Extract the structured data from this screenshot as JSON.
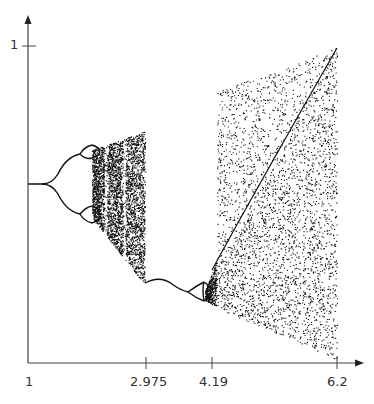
{
  "chart_data": {
    "type": "scatter",
    "title": "",
    "subtitle": "",
    "xlabel": "",
    "ylabel": "",
    "x_ticks": [
      "1",
      "2.975",
      "4.19",
      "6.2"
    ],
    "x_tick_values": [
      1,
      2.975,
      4.19,
      6.2
    ],
    "y_ticks": [
      "1"
    ],
    "y_tick_values": [
      1
    ],
    "xlim": [
      1,
      6.4
    ],
    "ylim": [
      0,
      1.08
    ],
    "grid": false,
    "legend": null,
    "regions": [
      {
        "name": "period-doubling cascade 1",
        "x_start": 1.0,
        "x_end": 2.0
      },
      {
        "name": "chaotic band 1",
        "x_start": 2.0,
        "x_end": 2.975,
        "y_top_range": [
          0.63,
          0.72
        ],
        "y_bottom_range": [
          0.46,
          0.25
        ]
      },
      {
        "name": "stable branch descent",
        "x_start": 2.975,
        "x_end": 3.7
      },
      {
        "name": "period-doubling cascade 2",
        "x_start": 3.7,
        "x_end": 4.1
      },
      {
        "name": "chaotic band 2",
        "x_start": 4.19,
        "x_end": 6.2,
        "y_top_range": [
          0.85,
          1.0
        ],
        "y_bottom_range": [
          0.3,
          0.0
        ]
      }
    ],
    "colors": {
      "points": "#111111",
      "axes": "#444444",
      "background": "#ffffff"
    }
  },
  "axes": {
    "x_labels": [
      "1",
      "2.975",
      "4.19",
      "6.2"
    ],
    "y_label_1": "1"
  }
}
